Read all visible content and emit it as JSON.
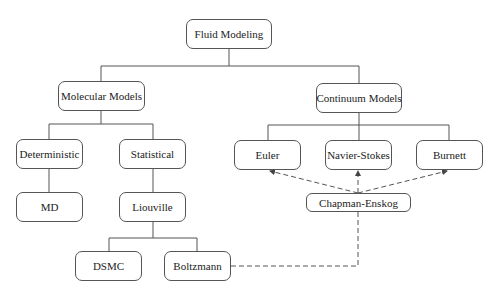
{
  "diagram": {
    "nodes": {
      "root": "Fluid Modeling",
      "molecular": "Molecular Models",
      "continuum": "Continuum Models",
      "deterministic": "Deterministic",
      "statistical": "Statistical",
      "md": "MD",
      "liouville": "Liouville",
      "dsmc": "DSMC",
      "boltzmann": "Boltzmann",
      "euler": "Euler",
      "navier_stokes": "Navier-Stokes",
      "burnett": "Burnett",
      "chapman_enskog": "Chapman-Enskog"
    },
    "edges": [
      {
        "from": "Fluid Modeling",
        "to": "Molecular Models",
        "style": "solid"
      },
      {
        "from": "Fluid Modeling",
        "to": "Continuum Models",
        "style": "solid"
      },
      {
        "from": "Molecular Models",
        "to": "Deterministic",
        "style": "solid"
      },
      {
        "from": "Molecular Models",
        "to": "Statistical",
        "style": "solid"
      },
      {
        "from": "Deterministic",
        "to": "MD",
        "style": "solid"
      },
      {
        "from": "Statistical",
        "to": "Liouville",
        "style": "solid"
      },
      {
        "from": "Liouville",
        "to": "DSMC",
        "style": "solid"
      },
      {
        "from": "Liouville",
        "to": "Boltzmann",
        "style": "solid"
      },
      {
        "from": "Continuum Models",
        "to": "Euler",
        "style": "solid"
      },
      {
        "from": "Continuum Models",
        "to": "Navier-Stokes",
        "style": "solid"
      },
      {
        "from": "Continuum Models",
        "to": "Burnett",
        "style": "solid"
      },
      {
        "from": "Boltzmann",
        "to": "Chapman-Enskog",
        "style": "dashed"
      },
      {
        "from": "Chapman-Enskog",
        "to": "Euler",
        "style": "dashed-arrow"
      },
      {
        "from": "Chapman-Enskog",
        "to": "Navier-Stokes",
        "style": "dashed-arrow"
      },
      {
        "from": "Chapman-Enskog",
        "to": "Burnett",
        "style": "dashed-arrow"
      }
    ]
  }
}
